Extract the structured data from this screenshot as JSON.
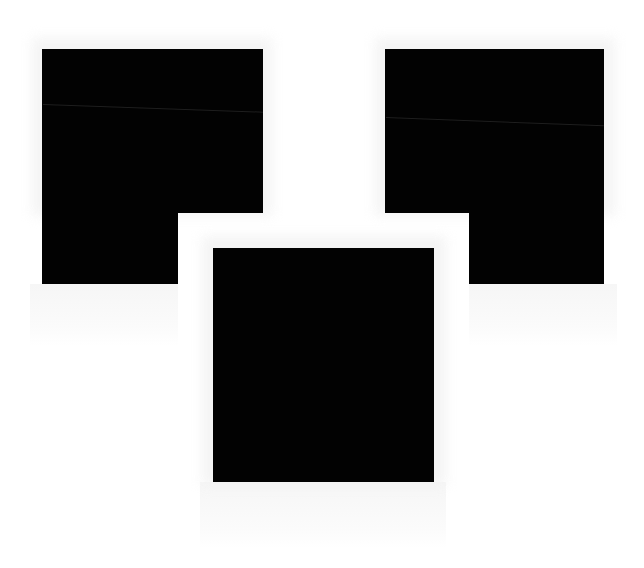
{
  "scene": {
    "description": "Three black polaroid-style photo frames on white background",
    "background_color": "#ffffff",
    "photo_color": "#020202"
  },
  "photos": [
    {
      "name": "left-photo",
      "x": 42,
      "y": 49,
      "w": 221,
      "h": 235,
      "notch": "bottom-right"
    },
    {
      "name": "right-photo",
      "x": 385,
      "y": 49,
      "w": 219,
      "h": 235,
      "notch": "bottom-left"
    },
    {
      "name": "center-photo",
      "x": 213,
      "y": 248,
      "w": 221,
      "h": 234,
      "notch": "none"
    }
  ]
}
